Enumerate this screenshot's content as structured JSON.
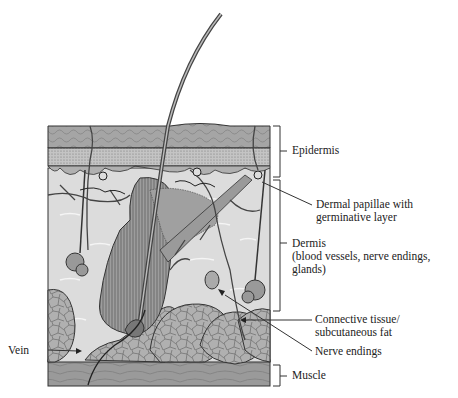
{
  "figure": {
    "colors": {
      "line": "#333333",
      "epidermis_top": "#9a9a9a",
      "epidermis_stipple": "#b5b5b5",
      "dermis": "#d8d8d8",
      "fat": "#a8a8a8",
      "muscle": "#8f8f8f",
      "background": "#ffffff"
    }
  },
  "labels": {
    "epidermis": "Epidermis",
    "dermal_papillae": [
      "Dermal papillae with",
      "germinative layer"
    ],
    "dermis": [
      "Dermis",
      "(blood vessels, nerve endings,",
      "glands)"
    ],
    "connective": [
      "Connective tissue/",
      "subcutaneous fat"
    ],
    "nerve_endings": "Nerve endings",
    "muscle": "Muscle",
    "vein": "Vein"
  }
}
